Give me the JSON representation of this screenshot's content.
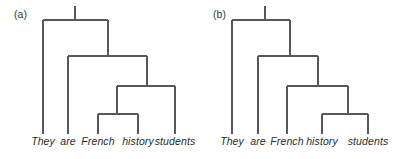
{
  "figure": {
    "type": "syntactic-tree-diagram",
    "background_color": "#ffffff",
    "line_color": "#58585a",
    "text_color": "#2b2b2b",
    "line_width": 1.1
  },
  "panels": [
    {
      "id": "a",
      "label": "(a)",
      "label_x": 14,
      "label_y": 8,
      "sentence": "They are French history students",
      "leaves": [
        {
          "word": "They",
          "x": 43,
          "baseline_y": 146,
          "stem_top": 20
        },
        {
          "word": "are",
          "x": 68,
          "baseline_y": 146,
          "stem_top": 56
        },
        {
          "word": "French",
          "x": 98,
          "baseline_y": 146,
          "stem_top": 114
        },
        {
          "word": "history",
          "x": 138,
          "baseline_y": 146,
          "stem_top": 114
        },
        {
          "word": "students",
          "x": 175,
          "baseline_y": 146,
          "stem_top": 86
        }
      ],
      "nodes": [
        {
          "level": 1,
          "bar_y": 20,
          "bar_x1": 43,
          "bar_x2": 108,
          "stem_x": 75,
          "stem_top": 6
        },
        {
          "level": 2,
          "bar_y": 56,
          "bar_x1": 68,
          "bar_x2": 147,
          "stem_x": 108,
          "stem_top": 20
        },
        {
          "level": 3,
          "bar_y": 86,
          "bar_x1": 117,
          "bar_x2": 175,
          "stem_x": 147,
          "stem_top": 56
        },
        {
          "level": 4,
          "bar_y": 114,
          "bar_x1": 98,
          "bar_x2": 138,
          "stem_x": 117,
          "stem_top": 86
        }
      ],
      "leaf_stem_bottom": 134
    },
    {
      "id": "b",
      "label": "(b)",
      "label_x": 14,
      "label_y": 8,
      "sentence": "They are French history students",
      "leaves": [
        {
          "word": "They",
          "x": 33,
          "baseline_y": 146,
          "stem_top": 20
        },
        {
          "word": "are",
          "x": 59,
          "baseline_y": 146,
          "stem_top": 56
        },
        {
          "word": "French",
          "x": 88,
          "baseline_y": 146,
          "stem_top": 86
        },
        {
          "word": "history",
          "x": 123,
          "baseline_y": 146,
          "stem_top": 114
        },
        {
          "word": "students",
          "x": 169,
          "baseline_y": 146,
          "stem_top": 114
        }
      ],
      "nodes": [
        {
          "level": 1,
          "bar_y": 20,
          "bar_x1": 33,
          "bar_x2": 91,
          "stem_x": 66,
          "stem_top": 6
        },
        {
          "level": 2,
          "bar_y": 56,
          "bar_x1": 59,
          "bar_x2": 119,
          "stem_x": 91,
          "stem_top": 20
        },
        {
          "level": 3,
          "bar_y": 86,
          "bar_x1": 88,
          "bar_x2": 149,
          "stem_x": 119,
          "stem_top": 56
        },
        {
          "level": 4,
          "bar_y": 114,
          "bar_x1": 123,
          "bar_x2": 169,
          "stem_x": 149,
          "stem_top": 86
        }
      ],
      "leaf_stem_bottom": 134
    }
  ]
}
